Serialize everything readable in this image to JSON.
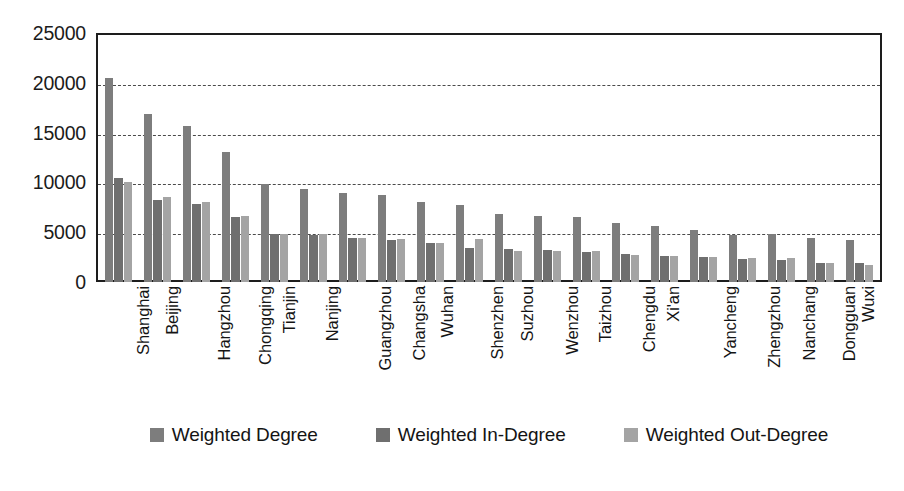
{
  "chart_data": {
    "type": "bar",
    "title": "",
    "xlabel": "",
    "ylabel": "",
    "ylim": [
      0,
      25000
    ],
    "ytick_step": 5000,
    "yticks": [
      25000,
      20000,
      15000,
      10000,
      5000,
      0
    ],
    "grid": true,
    "grid_style": "dashed-horizontal",
    "legend_position": "bottom",
    "categories": [
      "Shanghai",
      "Beijing",
      "Hangzhou",
      "Chongqing",
      "Tianjin",
      "Nanjing",
      "Guangzhou",
      "Changsha",
      "Wuhan",
      "Shenzhen",
      "Suzhou",
      "Wenzhou",
      "Taizhou",
      "Chengdu",
      "Xi'an",
      "Yancheng",
      "Zhengzhou",
      "Nanchang",
      "Dongguan",
      "Wuxi"
    ],
    "series": [
      {
        "name": "Weighted Degree",
        "color": "#7d7d7d",
        "values": [
          20500,
          16900,
          15700,
          13100,
          9800,
          9300,
          8900,
          8700,
          8000,
          7700,
          6800,
          6600,
          6500,
          5900,
          5600,
          5200,
          4700,
          4800,
          4400,
          4200
        ]
      },
      {
        "name": "Weighted In-Degree",
        "color": "#6f6f6f",
        "values": [
          10400,
          8200,
          7800,
          6500,
          4800,
          4700,
          4400,
          4200,
          3900,
          3400,
          3300,
          3200,
          3000,
          2800,
          2600,
          2500,
          2300,
          2200,
          1900,
          1900
        ]
      },
      {
        "name": "Weighted Out-Degree",
        "color": "#a4a4a4",
        "values": [
          10000,
          8500,
          8000,
          6600,
          4800,
          4800,
          4400,
          4300,
          3900,
          4300,
          3100,
          3100,
          3100,
          2700,
          2600,
          2500,
          2400,
          2400,
          1900,
          1700
        ]
      }
    ]
  }
}
